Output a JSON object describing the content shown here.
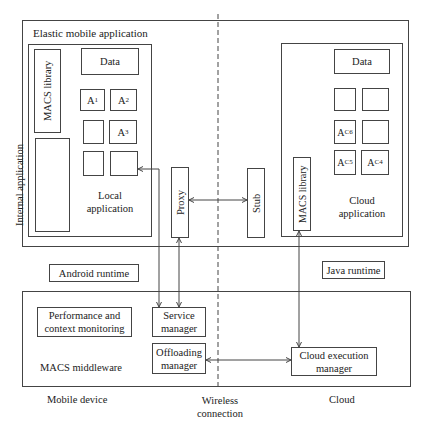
{
  "title": "Elastic mobile application",
  "local_app": {
    "label": "Local application",
    "macs_library": "MACS library",
    "internal_application": "Internal application",
    "data": "Data",
    "components": [
      {
        "base": "A",
        "sub": "1"
      },
      {
        "base": "A",
        "sub": "2"
      },
      {
        "base": "",
        "sub": ""
      },
      {
        "base": "A",
        "sub": "3"
      },
      {
        "base": "",
        "sub": ""
      },
      {
        "base": "",
        "sub": ""
      }
    ]
  },
  "proxy": "Proxy",
  "stub": "Stub",
  "cloud_app": {
    "label": "Cloud application",
    "macs_library": "MACS library",
    "data": "Data",
    "components": [
      {
        "base": "",
        "sub": ""
      },
      {
        "base": "",
        "sub": ""
      },
      {
        "base": "A",
        "sub": "C6"
      },
      {
        "base": "",
        "sub": ""
      },
      {
        "base": "A",
        "sub": "C5"
      },
      {
        "base": "A",
        "sub": "C4"
      }
    ]
  },
  "android_runtime": "Android runtime",
  "java_runtime": "Java runtime",
  "middleware": {
    "label": "MACS middleware",
    "performance": "Performance and context monitoring",
    "service_manager": "Service manager",
    "offloading_manager": "Offloading manager",
    "cloud_execution_manager": "Cloud execution manager"
  },
  "footer": {
    "mobile_device": "Mobile device",
    "wireless_connection": "Wireless connection",
    "cloud": "Cloud"
  },
  "colors": {
    "line": "#444444",
    "text": "#222222",
    "background": "#ffffff"
  }
}
